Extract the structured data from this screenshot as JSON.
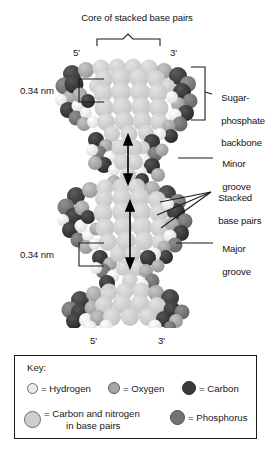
{
  "figure": {
    "title_top": "Core of stacked base pairs",
    "strand_labels": {
      "top_left": "5'",
      "top_right": "3'",
      "bottom_left": "5'",
      "bottom_right": "3'"
    },
    "annotations": [
      {
        "name": "core-of-stacked-base-pairs",
        "text": "Core of stacked base pairs"
      },
      {
        "name": "sugar-phosphate-backbone",
        "text": "Sugar-\nphosphate\nbackbone"
      },
      {
        "name": "rise-upper",
        "text": "0.34 nm"
      },
      {
        "name": "rise-lower",
        "text": "0.34 nm"
      },
      {
        "name": "minor-groove",
        "text": "Minor\ngroove"
      },
      {
        "name": "stacked-base-pairs",
        "text": "Stacked\nbase pairs"
      },
      {
        "name": "major-groove",
        "text": "Major\ngroove"
      }
    ],
    "sugar_phosphate_backbone_lines": [
      "Sugar-",
      "phosphate",
      "backbone"
    ],
    "minor_groove_lines": [
      "Minor",
      "groove"
    ],
    "major_groove_lines": [
      "Major",
      "groove"
    ],
    "stacked_base_pairs_lines": [
      "Stacked",
      "base pairs"
    ],
    "rise_upper": "0.34 nm",
    "rise_lower": "0.34 nm"
  },
  "key": {
    "title": "Key:",
    "entries": [
      {
        "label": "= Hydrogen",
        "color": "#ebebeb",
        "stroke": "#6b6b6b",
        "size": 11
      },
      {
        "label": "= Oxygen",
        "color": "#a6a6a6",
        "stroke": "#5a5a5a",
        "size": 12
      },
      {
        "label": "= Carbon",
        "color": "#3a3a3a",
        "stroke": "#2a2a2a",
        "size": 14
      },
      {
        "label": "= Carbon and nitrogen",
        "label2": "in base pairs",
        "color": "#cfcfcf",
        "stroke": "#6b6b6b",
        "size": 17
      },
      {
        "label": "= Phosphorus",
        "color": "#737373",
        "stroke": "#4a4a4a",
        "size": 15
      }
    ]
  },
  "palette": {
    "hydrogen": "#ebebeb",
    "oxygen": "#a6a6a6",
    "carbon": "#3a3a3a",
    "base_pair_carbon_nitrogen": "#cfcfcf",
    "phosphorus": "#737373",
    "line": "#1a1a1a",
    "background": "#ffffff"
  }
}
